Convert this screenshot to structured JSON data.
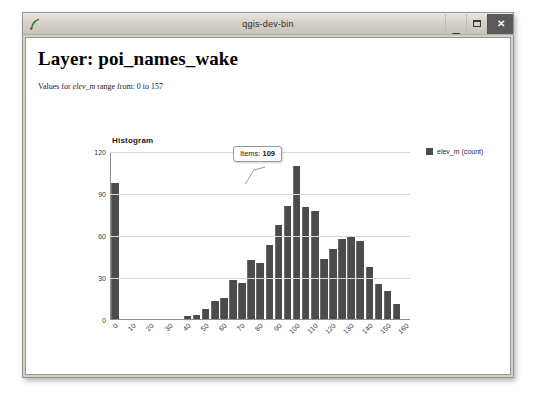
{
  "window": {
    "title": "qgis-dev-bin",
    "app_icon": "qgis-icon",
    "buttons": {
      "minimize": "minimize-icon",
      "maximize": "maximize-icon",
      "close": "close-icon"
    }
  },
  "page": {
    "title": "Layer: poi_names_wake",
    "subtitle_prefix": "Values for ",
    "subtitle_field": "elev_m",
    "subtitle_suffix": " range from: 0 to 157"
  },
  "legend": {
    "label": "elev_m (count)",
    "swatch_color": "#4b4b4b"
  },
  "tooltip": {
    "label": "Items:",
    "value": "109"
  },
  "chart_data": {
    "type": "bar",
    "title": "Histogram",
    "xlabel": "",
    "ylabel": "",
    "ylim": [
      0,
      120
    ],
    "xlim": [
      0,
      165
    ],
    "grid": true,
    "legend_position": "right",
    "bar_color": "#4b4b4b",
    "y_ticks": [
      0,
      30,
      60,
      90,
      120
    ],
    "x_ticks": [
      0,
      10,
      20,
      30,
      40,
      50,
      60,
      70,
      80,
      90,
      100,
      110,
      120,
      130,
      140,
      150,
      160
    ],
    "bin_width": 5,
    "categories": [
      "0",
      "5",
      "10",
      "15",
      "20",
      "25",
      "30",
      "35",
      "40",
      "45",
      "50",
      "55",
      "60",
      "65",
      "70",
      "75",
      "80",
      "85",
      "90",
      "95",
      "100",
      "105",
      "110",
      "115",
      "120",
      "125",
      "130",
      "135",
      "140",
      "145",
      "150",
      "155"
    ],
    "values": [
      97,
      0,
      0,
      0,
      0,
      0,
      0,
      0,
      2,
      3,
      7,
      13,
      15,
      28,
      26,
      42,
      40,
      53,
      67,
      81,
      109,
      80,
      77,
      43,
      50,
      57,
      59,
      56,
      37,
      25,
      20,
      11
    ],
    "annotations": [
      {
        "text": "Items: 109",
        "bin": "100",
        "value": 109
      }
    ]
  }
}
